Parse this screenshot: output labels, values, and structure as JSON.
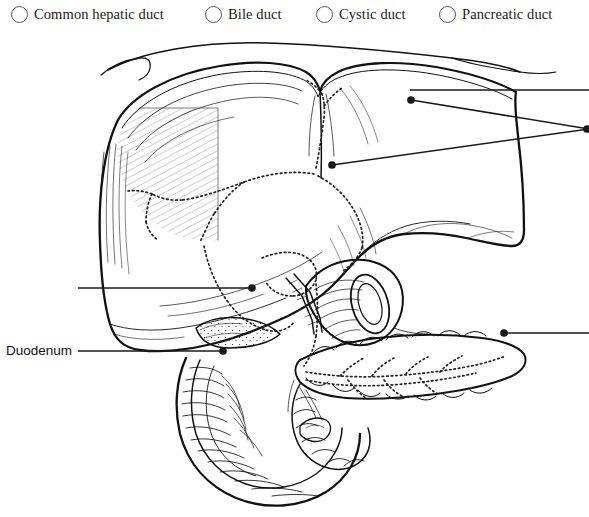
{
  "options": [
    {
      "id": "common-hepatic-duct",
      "label": "Common hepatic duct",
      "icon": "radio-circle-icon"
    },
    {
      "id": "bile-duct",
      "label": "Bile duct",
      "icon": "radio-circle-icon"
    },
    {
      "id": "cystic-duct",
      "label": "Cystic duct",
      "icon": "radio-circle-icon"
    },
    {
      "id": "pancreatic-duct",
      "label": "Pancreatic duct",
      "icon": "radio-circle-icon"
    }
  ],
  "side_labels": [
    {
      "id": "duodenum",
      "label": "Duodenum"
    }
  ],
  "figure": {
    "style": "black and white pen-and-ink anatomical illustration",
    "organs": [
      "liver",
      "gallbladder",
      "pancreas",
      "duodenum",
      "stomach outline",
      "biliary duct tree (dotted)"
    ],
    "leaders": [
      {
        "id": "leader-left-upper",
        "from_x": 78,
        "from_y": 260,
        "to_x": 253,
        "to_y": 260,
        "dot": "end",
        "target": "gallbladder"
      },
      {
        "id": "leader-duodenum",
        "from_x": 78,
        "from_y": 323,
        "to_x": 224,
        "to_y": 323,
        "dot": "end",
        "target": "duodenum"
      },
      {
        "id": "leader-right-top",
        "from_x": 589,
        "from_y": 62,
        "to_x": 410,
        "to_y": 62,
        "dot": "none",
        "target": "liver-superior-surface"
      },
      {
        "id": "leader-right-upper-converge",
        "from_x": 589,
        "from_y": 101,
        "to_x": 411,
        "to_y": 72,
        "dot": "end",
        "target": "common-hepatic-duct"
      },
      {
        "id": "leader-right-lower-converge",
        "from_x": 589,
        "from_y": 101,
        "to_x": 332,
        "to_y": 137,
        "dot": "end",
        "target": "bile-duct"
      },
      {
        "id": "leader-right-pancreas",
        "from_x": 589,
        "from_y": 305,
        "to_x": 503,
        "to_y": 305,
        "dot": "end",
        "target": "pancreatic-duct"
      }
    ],
    "colors": {
      "ink": "#111111",
      "paper": "#ffffff",
      "leader": "#1a1a1a",
      "dotted_duct": "#222222"
    }
  }
}
